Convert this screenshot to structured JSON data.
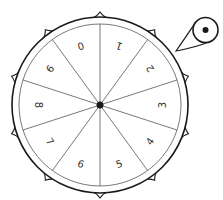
{
  "figure": {
    "type": "spinner-wheel",
    "width": 223,
    "height": 200,
    "colors": {
      "stroke": "#1a1a1a",
      "thin_stroke": "#555555",
      "text": "#333333",
      "background": "#ffffff"
    }
  },
  "wheel": {
    "center": [
      100,
      105
    ],
    "outer_radius": 88,
    "inner_radius": 81,
    "hub_radius": 3.5,
    "label_radius": 62,
    "sector_count": 10,
    "labels": [
      "0",
      "1",
      "2",
      "3",
      "4",
      "5",
      "6",
      "7",
      "8",
      "9"
    ],
    "peg_count": 10
  },
  "pointer": {
    "center": [
      205.5,
      30
    ],
    "radius": 12.5,
    "dot_radius": 3,
    "tip": [
      176,
      51
    ]
  }
}
